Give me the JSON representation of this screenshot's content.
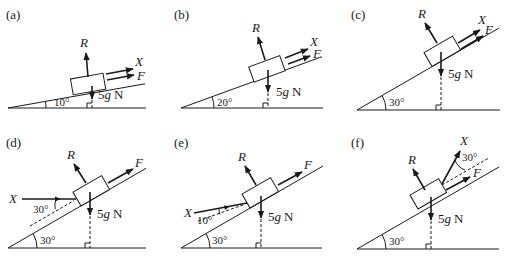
{
  "colors": {
    "ink": "#1a1a1a",
    "background": "#ffffff"
  },
  "panels": [
    {
      "id": "a",
      "label": "(a)",
      "incline_angle": "10°",
      "forces": {
        "normal": "R",
        "weight": "5g N",
        "applied": "X",
        "friction": "F"
      },
      "applied_direction": "parallel up slope"
    },
    {
      "id": "b",
      "label": "(b)",
      "incline_angle": "20°",
      "forces": {
        "normal": "R",
        "weight": "5g N",
        "applied": "X",
        "friction": "F"
      },
      "applied_direction": "parallel up slope"
    },
    {
      "id": "c",
      "label": "(c)",
      "incline_angle": "30°",
      "forces": {
        "normal": "R",
        "weight": "5g N",
        "applied": "X",
        "friction": "F"
      },
      "applied_direction": "parallel up slope"
    },
    {
      "id": "d",
      "label": "(d)",
      "incline_angle": "30°",
      "applied_angle": "30°",
      "forces": {
        "normal": "R",
        "weight": "5g N",
        "applied": "X",
        "friction": "F"
      },
      "applied_direction": "horizontal, 30° below slope"
    },
    {
      "id": "e",
      "label": "(e)",
      "incline_angle": "30°",
      "applied_angle": "10°",
      "forces": {
        "normal": "R",
        "weight": "5g N",
        "applied": "X",
        "friction": "F"
      },
      "applied_direction": "10° to slope, from below"
    },
    {
      "id": "f",
      "label": "(f)",
      "incline_angle": "30°",
      "applied_angle": "30°",
      "forces": {
        "normal": "R",
        "weight": "5g N",
        "applied": "X",
        "friction": "F"
      },
      "applied_direction": "30° above slope"
    }
  ],
  "weight_unit_suffix": "N",
  "weight_symbol": "5g"
}
